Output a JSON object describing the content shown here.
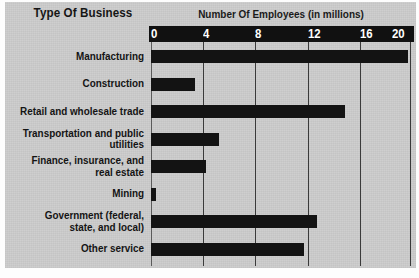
{
  "chart_data": {
    "type": "bar",
    "orientation": "horizontal",
    "title": "Number Of Employees (in millions)",
    "category_header": "Type Of Business",
    "xlabel": "Number Of Employees (in millions)",
    "ylabel": "Type Of Business",
    "xlim": [
      0,
      20
    ],
    "xticks": [
      0,
      4,
      8,
      12,
      16,
      20
    ],
    "xtick_labels": [
      "0",
      "4",
      "8",
      "12",
      "16",
      "20"
    ],
    "grid": true,
    "grid_axis": "x",
    "legend": "none",
    "bar_color": "#131313",
    "background_color": "#cdcdcd",
    "axis_band_color": "#111111",
    "axis_text_color": "#ffffff",
    "categories": [
      "Manufacturing",
      "Construction",
      "Retail and wholesale trade",
      "Transportation and public utilities",
      "Finance, insurance, and real estate",
      "Mining",
      "Government (federal, state, and local)",
      "Other service"
    ],
    "values": [
      19.7,
      3.4,
      14.9,
      5.2,
      4.2,
      0.4,
      12.7,
      11.7
    ]
  },
  "labels": {
    "rows": [
      {
        "line1": "Manufacturing",
        "line2": ""
      },
      {
        "line1": "Construction",
        "line2": ""
      },
      {
        "line1": "Retail and wholesale trade",
        "line2": ""
      },
      {
        "line1": "Transportation and public",
        "line2": "utilities"
      },
      {
        "line1": "Finance, insurance, and",
        "line2": "real estate"
      },
      {
        "line1": "Mining",
        "line2": ""
      },
      {
        "line1": "Government (federal,",
        "line2": "state, and local)"
      },
      {
        "line1": "Other service",
        "line2": ""
      }
    ]
  }
}
